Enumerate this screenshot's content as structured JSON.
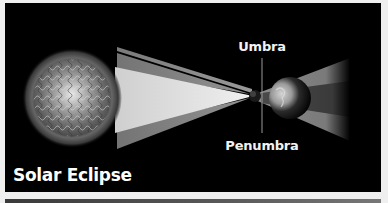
{
  "figure": {
    "title": "Solar Eclipse",
    "labels": {
      "umbra": "Umbra",
      "penumbra": "Penumbra"
    },
    "bodies": [
      {
        "name": "sun",
        "icon": "sun-icon"
      },
      {
        "name": "moon",
        "icon": "moon-icon"
      },
      {
        "name": "earth",
        "icon": "earth-icon"
      }
    ],
    "colors": {
      "background": "#000000",
      "page": "#efefef",
      "text": "#ffffff",
      "light_cone": "#d9d9d9",
      "penumbra_band": "#8a8a8a",
      "umbra_band": "#3c3c3c"
    }
  }
}
